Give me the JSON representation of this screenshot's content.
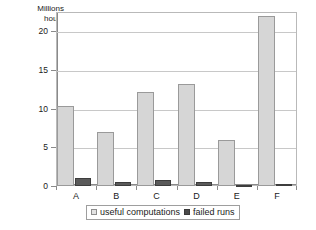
{
  "chart_data": {
    "type": "bar",
    "title": "",
    "xlabel": "",
    "ylabel": "Millions hours",
    "ylabel_line1": "Millions",
    "ylabel_line2": "hours",
    "categories": [
      "A",
      "B",
      "C",
      "D",
      "E",
      "F"
    ],
    "series": [
      {
        "name": "useful computations",
        "color": "#d6d6d6",
        "values": [
          10.3,
          7.0,
          12.1,
          13.1,
          6.0,
          22.0
        ]
      },
      {
        "name": "failed runs",
        "color": "#5a5a5a",
        "values": [
          1.0,
          0.5,
          0.8,
          0.5,
          0.05,
          0.2
        ]
      }
    ],
    "ylim": [
      0,
      20
    ],
    "yticks": [
      0,
      5,
      10,
      15,
      20
    ],
    "ytick_labels": [
      "0",
      "5",
      "10",
      "15",
      "20"
    ],
    "grid": true,
    "legend_position": "bottom"
  },
  "legend": {
    "items": [
      {
        "label": "useful computations"
      },
      {
        "label": "failed runs"
      }
    ]
  }
}
